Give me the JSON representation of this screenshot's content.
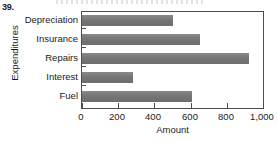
{
  "problem_number": "39.",
  "chart_data": {
    "type": "bar",
    "orientation": "horizontal",
    "title": "",
    "xlabel": "Amount",
    "ylabel": "Expenditures",
    "categories": [
      "Depreciation",
      "Insurance",
      "Repairs",
      "Interest",
      "Fuel"
    ],
    "values": [
      500,
      650,
      925,
      280,
      610
    ],
    "xlim": [
      0,
      1000
    ],
    "xticks": [
      0,
      200,
      400,
      600,
      800,
      1000
    ],
    "xtick_labels": [
      "0",
      "200",
      "400",
      "600",
      "800",
      "1,000"
    ],
    "grid": false,
    "legend": "none",
    "bar_color": "#787878",
    "axis_color": "#4d4d4d"
  }
}
